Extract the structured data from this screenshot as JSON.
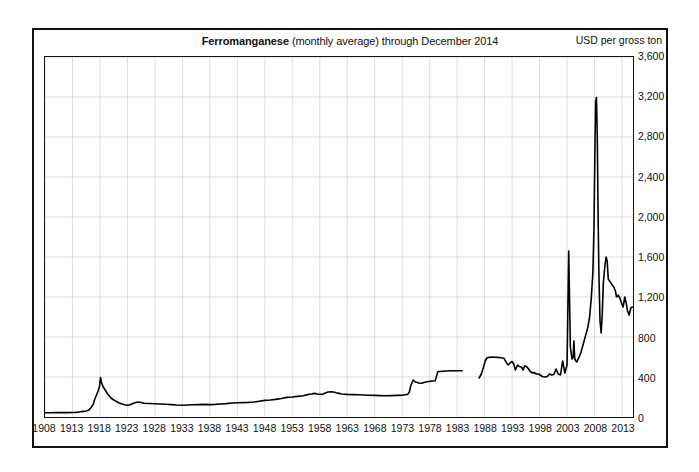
{
  "chart_data": {
    "type": "line",
    "title": "Ferromanganese",
    "subtitle": "(monthly average) through December 2014",
    "unit_label": "USD per gross ton",
    "xlabel": "",
    "ylabel": "USD per gross ton",
    "xlim": [
      1908,
      2015
    ],
    "ylim": [
      0,
      3600
    ],
    "ytick_step": 400,
    "xtick_step": 5,
    "grid": true,
    "legend": "none",
    "ytick_labels": [
      "0",
      "400",
      "800",
      "1,200",
      "1,600",
      "2,000",
      "2,400",
      "2,800",
      "3,200",
      "3,600"
    ],
    "ytick_values": [
      0,
      400,
      800,
      1200,
      1600,
      2000,
      2400,
      2800,
      3200,
      3600
    ],
    "xtick_labels": [
      "1908",
      "1913",
      "1918",
      "1923",
      "1928",
      "1933",
      "1938",
      "1943",
      "1948",
      "1953",
      "1958",
      "1963",
      "1968",
      "1973",
      "1978",
      "1983",
      "1988",
      "1993",
      "1998",
      "2003",
      "2008",
      "2013"
    ],
    "xtick_values": [
      1908,
      1913,
      1918,
      1923,
      1928,
      1933,
      1938,
      1943,
      1948,
      1953,
      1958,
      1963,
      1968,
      1973,
      1978,
      1983,
      1988,
      1993,
      1998,
      2003,
      2008,
      2013
    ],
    "series": [
      {
        "name": "Ferromanganese price",
        "color": "#000000",
        "segments": [
          {
            "name": "1908-1983",
            "x": [
              1908,
              1909,
              1910,
              1911,
              1912,
              1913,
              1913.5,
              1914,
              1914.5,
              1915,
              1915.5,
              1916,
              1916.4,
              1916.8,
              1917,
              1917.3,
              1917.6,
              1917.9,
              1918.1,
              1918.3,
              1918.6,
              1919,
              1919.4,
              1919.8,
              1920,
              1920.5,
              1921,
              1921.5,
              1922,
              1922.5,
              1923,
              1923.5,
              1924,
              1924.5,
              1925,
              1925.5,
              1926,
              1927,
              1928,
              1929,
              1930,
              1931,
              1932,
              1933,
              1934,
              1935,
              1936,
              1937,
              1938,
              1939,
              1940,
              1941,
              1942,
              1943,
              1944,
              1945,
              1946,
              1947,
              1948,
              1949,
              1950,
              1951,
              1952,
              1953,
              1954,
              1955,
              1956,
              1956.5,
              1957,
              1957.5,
              1958,
              1958.5,
              1959,
              1959.5,
              1960,
              1960.5,
              1961,
              1961.5,
              1962,
              1963,
              1964,
              1965,
              1966,
              1967,
              1968,
              1969,
              1970,
              1971,
              1972,
              1973,
              1973.5,
              1974,
              1974.3,
              1974.6,
              1975,
              1975.4,
              1975.8,
              1976,
              1976.5,
              1977,
              1977.5,
              1978,
              1978.5,
              1979,
              1979.5,
              1980,
              1980.5,
              1981,
              1982,
              1983,
              1983.9
            ],
            "y": [
              43,
              42,
              44,
              45,
              44,
              45,
              46,
              48,
              52,
              56,
              60,
              70,
              95,
              130,
              170,
              210,
              250,
              300,
              395,
              340,
              300,
              265,
              230,
              205,
              190,
              170,
              155,
              140,
              130,
              122,
              118,
              122,
              135,
              145,
              150,
              145,
              138,
              135,
              132,
              130,
              128,
              124,
              120,
              118,
              120,
              122,
              124,
              126,
              124,
              126,
              130,
              134,
              140,
              142,
              144,
              146,
              150,
              158,
              166,
              170,
              176,
              185,
              196,
              200,
              206,
              212,
              226,
              230,
              236,
              230,
              228,
              226,
              240,
              250,
              252,
              250,
              242,
              236,
              230,
              226,
              224,
              222,
              220,
              218,
              216,
              214,
              212,
              214,
              216,
              218,
              222,
              226,
              250,
              320,
              370,
              350,
              345,
              340,
              338,
              345,
              352,
              356,
              360,
              362,
              455,
              456,
              458,
              460,
              462,
              462,
              463,
              462,
              462,
              462,
              462
            ]
          },
          {
            "name": "1987-2014",
            "x": [
              1987.0,
              1987.4,
              1987.8,
              1988.1,
              1988.4,
              1988.7,
              1989.2,
              1989.8,
              1990.4,
              1991,
              1991.5,
              1992,
              1992.3,
              1992.7,
              1993,
              1993.3,
              1993.6,
              1994,
              1994.3,
              1994.7,
              1995,
              1995.3,
              1995.7,
              1996,
              1996.3,
              1996.7,
              1997,
              1997.4,
              1997.8,
              1998.1,
              1998.5,
              1999,
              1999.4,
              1999.8,
              2000.2,
              2000.6,
              2001,
              2001.4,
              2001.8,
              2002.2,
              2002.6,
              2003,
              2003.3,
              2003.6,
              2003.9,
              2004.1,
              2004.25,
              2004.4,
              2004.6,
              2004.8,
              2005.0,
              2005.2,
              2005.5,
              2005.8,
              2006.1,
              2006.4,
              2006.8,
              2007.1,
              2007.4,
              2007.7,
              2007.9,
              2008.05,
              2008.2,
              2008.35,
              2008.5,
              2008.65,
              2008.8,
              2009.0,
              2009.2,
              2009.4,
              2009.6,
              2009.9,
              2010.1,
              2010.3,
              2010.5,
              2010.8,
              2011.0,
              2011.2,
              2011.5,
              2011.8,
              2012.0,
              2012.3,
              2012.6,
              2012.9,
              2013.2,
              2013.5,
              2013.8,
              2014.0,
              2014.3,
              2014.6,
              2014.9
            ],
            "y": [
              390,
              430,
              500,
              560,
              590,
              595,
              600,
              598,
              596,
              592,
              588,
              540,
              520,
              545,
              555,
              530,
              470,
              520,
              505,
              500,
              470,
              512,
              500,
              480,
              455,
              440,
              445,
              430,
              430,
              420,
              405,
              400,
              405,
              430,
              420,
              425,
              480,
              430,
              420,
              560,
              440,
              520,
              1660,
              700,
              580,
              600,
              760,
              580,
              560,
              550,
              580,
              600,
              640,
              700,
              760,
              820,
              900,
              1000,
              1180,
              1450,
              1900,
              2600,
              3150,
              3195,
              2800,
              2000,
              1420,
              960,
              840,
              1020,
              1340,
              1520,
              1600,
              1560,
              1380,
              1355,
              1340,
              1320,
              1300,
              1260,
              1200,
              1220,
              1190,
              1140,
              1100,
              1200,
              1130,
              1060,
              1020,
              1090,
              1100,
              1050
            ]
          }
        ]
      }
    ]
  }
}
